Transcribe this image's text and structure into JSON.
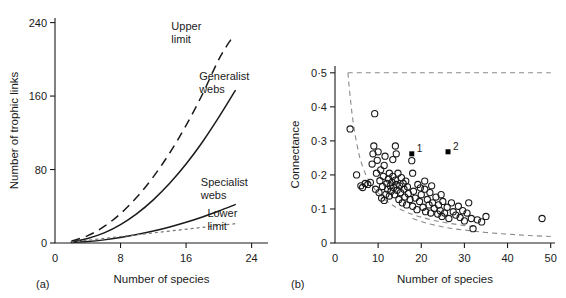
{
  "figure": {
    "panel_a_tag": "(a)",
    "panel_b_tag": "(b)"
  },
  "chart_data": [
    {
      "type": "line",
      "panel": "(a)",
      "title": "",
      "xlabel": "Number of species",
      "ylabel": "Number of trophic links",
      "xlim": [
        0,
        26
      ],
      "ylim": [
        0,
        245
      ],
      "xticks": [
        0,
        8,
        16,
        24
      ],
      "yticks": [
        0,
        80,
        160,
        240
      ],
      "xticklabels": [
        "0",
        "8",
        "16",
        "24"
      ],
      "yticklabels": [
        "0",
        "80",
        "160",
        "240"
      ],
      "grid": false,
      "legend": "inline-annotations",
      "series": [
        {
          "name": "Upper limit",
          "style": "dashed",
          "label": "Upper limit",
          "label_lines": [
            "Upper",
            "limit"
          ],
          "x": [
            2,
            4,
            6,
            8,
            10,
            12,
            14,
            16,
            18,
            20,
            21.5
          ],
          "y": [
            2,
            8,
            18,
            32,
            50,
            72,
            98,
            128,
            162,
            200,
            222
          ]
        },
        {
          "name": "Generalist webs",
          "style": "solid",
          "label": "Generalist webs",
          "label_lines": [
            "Generalist",
            "webs"
          ],
          "x": [
            2,
            4,
            6,
            8,
            10,
            12,
            14,
            16,
            18,
            20,
            22
          ],
          "y": [
            1,
            5,
            11,
            20,
            32,
            47,
            65,
            86,
            110,
            137,
            166
          ]
        },
        {
          "name": "Specialist webs",
          "style": "solid",
          "label": "Specialist webs",
          "label_lines": [
            "Specialist",
            "webs"
          ],
          "x": [
            2,
            4,
            6,
            8,
            10,
            12,
            14,
            16,
            18,
            20,
            22
          ],
          "y": [
            0.5,
            1.6,
            3.4,
            6,
            9.2,
            13,
            17.5,
            22.6,
            28.4,
            34.8,
            41.8
          ]
        },
        {
          "name": "Lower limit",
          "style": "dotted",
          "label": "Lower limit",
          "label_lines": [
            "Lower",
            "limit"
          ],
          "x": [
            2,
            6,
            10,
            14,
            18,
            22
          ],
          "y": [
            1,
            5,
            9,
            13,
            17,
            21
          ]
        }
      ],
      "annotations": [
        {
          "text_lines": [
            "Upper",
            "limit"
          ],
          "x": 14.2,
          "y": 232
        },
        {
          "text_lines": [
            "Generalist",
            "webs"
          ],
          "x": 17.6,
          "y": 178
        },
        {
          "text_lines": [
            "Specialist",
            "webs"
          ],
          "x": 17.8,
          "y": 62
        },
        {
          "text_lines": [
            "Lower",
            "limit"
          ],
          "x": 18.6,
          "y": 28
        }
      ]
    },
    {
      "type": "scatter",
      "panel": "(b)",
      "title": "",
      "xlabel": "Number of species",
      "ylabel": "Connectance",
      "xlim": [
        0,
        51
      ],
      "ylim": [
        0,
        0.52
      ],
      "xticks": [
        0,
        10,
        20,
        30,
        40,
        50
      ],
      "yticks": [
        0,
        0.1,
        0.2,
        0.3,
        0.4,
        0.5
      ],
      "xticklabels": [
        "0",
        "10",
        "20",
        "30",
        "40",
        "50"
      ],
      "yticklabels": [
        "0",
        "0·1",
        "0·2",
        "0·3",
        "0·4",
        "0·5"
      ],
      "grid": false,
      "legend": "none",
      "boundaries": [
        {
          "name": "upper-limit-boundary",
          "style": "dashed",
          "description": "horizontal ceiling at connectance 0.5 then hyperbolic descent",
          "x": [
            3.0,
            3.2,
            3.6,
            4.0,
            4.5,
            5.0,
            5.5,
            6.0,
            7.0,
            8.0,
            9.0,
            10.0,
            12.0,
            14.0,
            16.0,
            18.0,
            20.0,
            23.0,
            26.0,
            29.0,
            32.0
          ],
          "y": [
            0.5,
            0.47,
            0.42,
            0.375,
            0.33,
            0.295,
            0.265,
            0.24,
            0.205,
            0.18,
            0.162,
            0.147,
            0.123,
            0.106,
            0.094,
            0.084,
            0.076,
            0.066,
            0.059,
            0.053,
            0.048
          ]
        },
        {
          "name": "ceiling-line",
          "style": "dashed",
          "description": "horizontal dashed line at connectance 0.5",
          "x": [
            3.0,
            50.0
          ],
          "y": [
            0.5,
            0.5
          ]
        },
        {
          "name": "lower-limit-boundary",
          "style": "dashed",
          "description": "lower hyperbolic envelope",
          "x": [
            18.0,
            20.0,
            22.0,
            24.0,
            26.0,
            28.0,
            30.0,
            32.0,
            35.0,
            40.0,
            45.0,
            50.0
          ],
          "y": [
            0.072,
            0.063,
            0.056,
            0.05,
            0.045,
            0.041,
            0.038,
            0.035,
            0.031,
            0.026,
            0.022,
            0.019
          ]
        }
      ],
      "open_points": [
        {
          "x": 3.5,
          "y": 0.335
        },
        {
          "x": 5.0,
          "y": 0.2
        },
        {
          "x": 6.0,
          "y": 0.168
        },
        {
          "x": 6.4,
          "y": 0.163
        },
        {
          "x": 7.0,
          "y": 0.175
        },
        {
          "x": 7.6,
          "y": 0.172
        },
        {
          "x": 8.2,
          "y": 0.178
        },
        {
          "x": 8.6,
          "y": 0.232
        },
        {
          "x": 8.8,
          "y": 0.262
        },
        {
          "x": 9.0,
          "y": 0.285
        },
        {
          "x": 9.2,
          "y": 0.38
        },
        {
          "x": 9.4,
          "y": 0.158
        },
        {
          "x": 9.6,
          "y": 0.205
        },
        {
          "x": 9.8,
          "y": 0.243
        },
        {
          "x": 10.0,
          "y": 0.268
        },
        {
          "x": 10.2,
          "y": 0.148
        },
        {
          "x": 10.4,
          "y": 0.183
        },
        {
          "x": 10.6,
          "y": 0.215
        },
        {
          "x": 10.8,
          "y": 0.132
        },
        {
          "x": 11.0,
          "y": 0.166
        },
        {
          "x": 11.2,
          "y": 0.196
        },
        {
          "x": 11.4,
          "y": 0.228
        },
        {
          "x": 11.6,
          "y": 0.255
        },
        {
          "x": 11.8,
          "y": 0.143
        },
        {
          "x": 12.0,
          "y": 0.175
        },
        {
          "x": 12.2,
          "y": 0.158
        },
        {
          "x": 12.4,
          "y": 0.188
        },
        {
          "x": 12.6,
          "y": 0.205
        },
        {
          "x": 12.8,
          "y": 0.168
        },
        {
          "x": 13.0,
          "y": 0.152
        },
        {
          "x": 13.2,
          "y": 0.178
        },
        {
          "x": 13.4,
          "y": 0.196
        },
        {
          "x": 13.6,
          "y": 0.163
        },
        {
          "x": 13.8,
          "y": 0.142
        },
        {
          "x": 14.0,
          "y": 0.185
        },
        {
          "x": 14.2,
          "y": 0.172
        },
        {
          "x": 14.4,
          "y": 0.155
        },
        {
          "x": 14.6,
          "y": 0.205
        },
        {
          "x": 14.8,
          "y": 0.128
        },
        {
          "x": 14.0,
          "y": 0.285
        },
        {
          "x": 15.0,
          "y": 0.168
        },
        {
          "x": 15.2,
          "y": 0.148
        },
        {
          "x": 15.4,
          "y": 0.192
        },
        {
          "x": 15.6,
          "y": 0.118
        },
        {
          "x": 15.8,
          "y": 0.175
        },
        {
          "x": 16.0,
          "y": 0.158
        },
        {
          "x": 16.2,
          "y": 0.135
        },
        {
          "x": 16.4,
          "y": 0.182
        },
        {
          "x": 16.6,
          "y": 0.112
        },
        {
          "x": 16.8,
          "y": 0.165
        },
        {
          "x": 17.0,
          "y": 0.145
        },
        {
          "x": 17.4,
          "y": 0.128
        },
        {
          "x": 17.8,
          "y": 0.242
        },
        {
          "x": 18.0,
          "y": 0.108
        },
        {
          "x": 18.2,
          "y": 0.152
        },
        {
          "x": 18.6,
          "y": 0.132
        },
        {
          "x": 19.0,
          "y": 0.098
        },
        {
          "x": 19.2,
          "y": 0.172
        },
        {
          "x": 19.6,
          "y": 0.122
        },
        {
          "x": 20.0,
          "y": 0.142
        },
        {
          "x": 20.4,
          "y": 0.105
        },
        {
          "x": 20.8,
          "y": 0.158
        },
        {
          "x": 21.0,
          "y": 0.092
        },
        {
          "x": 21.4,
          "y": 0.128
        },
        {
          "x": 21.8,
          "y": 0.112
        },
        {
          "x": 22.0,
          "y": 0.148
        },
        {
          "x": 22.2,
          "y": 0.088
        },
        {
          "x": 22.6,
          "y": 0.118
        },
        {
          "x": 23.0,
          "y": 0.102
        },
        {
          "x": 23.4,
          "y": 0.135
        },
        {
          "x": 23.8,
          "y": 0.085
        },
        {
          "x": 24.0,
          "y": 0.112
        },
        {
          "x": 24.4,
          "y": 0.095
        },
        {
          "x": 24.8,
          "y": 0.078
        },
        {
          "x": 25.0,
          "y": 0.122
        },
        {
          "x": 25.4,
          "y": 0.088
        },
        {
          "x": 26.0,
          "y": 0.105
        },
        {
          "x": 26.4,
          "y": 0.072
        },
        {
          "x": 27.0,
          "y": 0.118
        },
        {
          "x": 27.4,
          "y": 0.092
        },
        {
          "x": 28.0,
          "y": 0.082
        },
        {
          "x": 28.6,
          "y": 0.108
        },
        {
          "x": 29.0,
          "y": 0.075
        },
        {
          "x": 29.6,
          "y": 0.095
        },
        {
          "x": 30.0,
          "y": 0.065
        },
        {
          "x": 30.6,
          "y": 0.088
        },
        {
          "x": 31.0,
          "y": 0.118
        },
        {
          "x": 31.6,
          "y": 0.072
        },
        {
          "x": 32.0,
          "y": 0.042
        },
        {
          "x": 33.0,
          "y": 0.068
        },
        {
          "x": 34.0,
          "y": 0.062
        },
        {
          "x": 35.0,
          "y": 0.078
        },
        {
          "x": 48.0,
          "y": 0.072
        },
        {
          "x": 13.4,
          "y": 0.245
        },
        {
          "x": 14.2,
          "y": 0.262
        },
        {
          "x": 18.0,
          "y": 0.205
        },
        {
          "x": 22.4,
          "y": 0.168
        },
        {
          "x": 20.8,
          "y": 0.182
        },
        {
          "x": 12.6,
          "y": 0.138
        },
        {
          "x": 19.8,
          "y": 0.162
        },
        {
          "x": 11.4,
          "y": 0.125
        },
        {
          "x": 24.6,
          "y": 0.142
        }
      ],
      "filled_points": [
        {
          "x": 17.8,
          "y": 0.262,
          "label": "1"
        },
        {
          "x": 26.2,
          "y": 0.268,
          "label": "2"
        }
      ]
    }
  ]
}
